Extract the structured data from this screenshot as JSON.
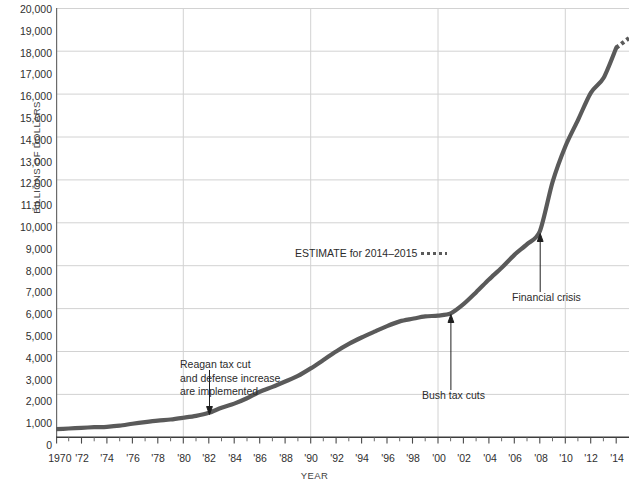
{
  "chart_data": {
    "type": "line",
    "title": "",
    "xlabel": "YEAR",
    "ylabel": "BILLIONS OF DOLLARS",
    "xlim": [
      1970,
      2015
    ],
    "ylim": [
      0,
      20000
    ],
    "grid": "major gridlines at every 2,000 on y and every 10 years on x",
    "legend": "none",
    "line_color": "#5a5a5a",
    "y_ticks": [
      "20,000",
      "19,000",
      "18,000",
      "17,000",
      "16,000",
      "15,000",
      "14,000",
      "13,000",
      "12,000",
      "11,000",
      "10,000",
      "9,000",
      "8,000",
      "7,000",
      "6,000",
      "5,000",
      "4,000",
      "3,000",
      "2,000",
      "1,000",
      "0"
    ],
    "x_ticks": [
      "1970",
      "'72",
      "'74",
      "'76",
      "'78",
      "'80",
      "'82",
      "'84",
      "'86",
      "'88",
      "'90",
      "'92",
      "'94",
      "'96",
      "'98",
      "'00",
      "'02",
      "'04",
      "'06",
      "'08",
      "'10",
      "'12",
      "'14"
    ],
    "x": [
      1970,
      1971,
      1972,
      1973,
      1974,
      1975,
      1976,
      1977,
      1978,
      1979,
      1980,
      1981,
      1982,
      1983,
      1984,
      1985,
      1986,
      1987,
      1988,
      1989,
      1990,
      1991,
      1992,
      1993,
      1994,
      1995,
      1996,
      1997,
      1998,
      1999,
      2000,
      2001,
      2002,
      2003,
      2004,
      2005,
      2006,
      2007,
      2008,
      2009,
      2010,
      2011,
      2012,
      2013,
      2014,
      2015
    ],
    "values": [
      380,
      410,
      440,
      470,
      490,
      540,
      630,
      710,
      780,
      830,
      910,
      1000,
      1140,
      1380,
      1570,
      1820,
      2120,
      2350,
      2600,
      2860,
      3210,
      3600,
      4000,
      4350,
      4650,
      4920,
      5180,
      5400,
      5520,
      5630,
      5670,
      5770,
      6200,
      6760,
      7350,
      7900,
      8500,
      9000,
      9600,
      11900,
      13550,
      14790,
      16050,
      16740,
      18150,
      18600
    ],
    "estimate_start_year": 2014,
    "estimate_note": "dashed segment beyond 2014 represents the estimate"
  },
  "axis": {
    "y_title": "BILLIONS OF DOLLARS",
    "x_title": "YEAR"
  },
  "annotations": {
    "reagan": {
      "line1": "Reagan tax cut",
      "line2": "and defense increase",
      "line3": "are implemented",
      "points_to_year": 1982,
      "points_to_value": 1140
    },
    "bush": {
      "label": "Bush tax cuts",
      "points_to_year": 2001,
      "points_to_value": 5770
    },
    "crisis": {
      "label": "Financial crisis",
      "points_to_year": 2008,
      "points_to_value": 9600
    },
    "estimate": {
      "label": "ESTIMATE for 2014–2015"
    }
  }
}
